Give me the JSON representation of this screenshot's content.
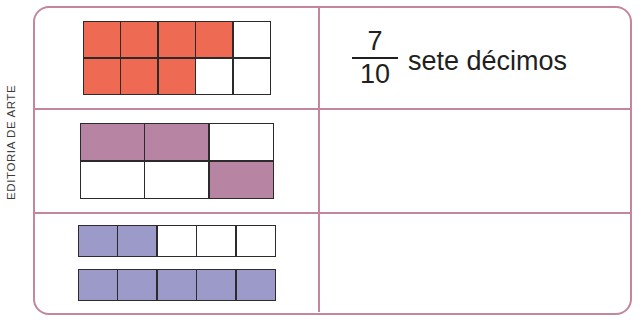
{
  "credit": {
    "label": "EDITORIA DE ARTE"
  },
  "table": {
    "border_color": "#c4869c",
    "columns": [
      "diagram",
      "answer"
    ],
    "rows": [
      {
        "id": "row-1",
        "diagram": {
          "name": "tenths-grid",
          "type": "grid",
          "columns": 5,
          "rows": 2,
          "total_parts": 10,
          "shaded_parts": 7,
          "fill_color": "#ee6a52",
          "stroke_color": "#2b2b2b",
          "shaded_cells": [
            [
              true,
              true,
              true,
              true,
              false
            ],
            [
              true,
              true,
              true,
              false,
              false
            ]
          ]
        },
        "answer": {
          "filled": true,
          "numerator": "7",
          "denominator": "10",
          "words": "sete décimos"
        }
      },
      {
        "id": "row-2",
        "diagram": {
          "name": "sixths-grid",
          "type": "grid",
          "columns": 3,
          "rows": 2,
          "total_parts": 6,
          "shaded_parts": 3,
          "fill_color": "#b784a4",
          "stroke_color": "#2b2b2b",
          "shaded_cells": [
            [
              true,
              true,
              false
            ],
            [
              false,
              false,
              true
            ]
          ]
        },
        "answer": {
          "filled": false,
          "numerator": "",
          "denominator": "",
          "words": ""
        }
      },
      {
        "id": "row-3",
        "diagram": {
          "name": "fifths-strips",
          "type": "strips",
          "strip_count": 2,
          "cells_per_strip": 5,
          "total_parts": 10,
          "shaded_parts": 7,
          "fill_color": "#9c9ac8",
          "stroke_color": "#2b2b2b",
          "strips": [
            {
              "name": "strip-top",
              "shaded_cells": [
                true,
                true,
                false,
                false,
                false
              ]
            },
            {
              "name": "strip-bottom",
              "shaded_cells": [
                true,
                true,
                true,
                true,
                true
              ]
            }
          ]
        },
        "answer": {
          "filled": false,
          "numerator": "",
          "denominator": "",
          "words": ""
        }
      }
    ]
  }
}
